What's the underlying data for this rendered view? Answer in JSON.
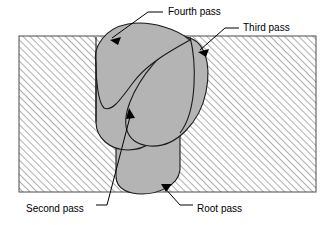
{
  "figure": {
    "colors": {
      "weld_fill": "#b4b4b4",
      "base_metal_fill": "#ffffff",
      "hatch_line": "#9a9a9a",
      "outline": "#1a1a1a",
      "background": "#ffffff",
      "text": "#000000"
    },
    "base_metal": {
      "name": "base-metal-plate",
      "hatch_angle_deg": 45,
      "hatch_spacing_px": 5,
      "bounds": {
        "x": 19,
        "y": 36,
        "width": 297,
        "height": 156
      }
    },
    "labels": [
      {
        "id": "fourth-pass",
        "text": "Fourth pass",
        "text_x": 168,
        "text_y": 12,
        "leader": "M 163 12 L 148 12 L 112 38",
        "arrow_tip_x": 110,
        "arrow_tip_y": 40,
        "arrow_angle_deg": 215
      },
      {
        "id": "third-pass",
        "text": "Third pass",
        "text_x": 243,
        "text_y": 28,
        "leader": "M 239 28 L 225 28 L 200 50",
        "arrow_tip_x": 198,
        "arrow_tip_y": 52,
        "arrow_angle_deg": 218
      },
      {
        "id": "second-pass",
        "text": "Second pass",
        "text_x": 26,
        "text_y": 209,
        "leader": "M 96 205 L 107 205 L 131 113",
        "arrow_tip_x": 129,
        "arrow_tip_y": 108,
        "arrow_angle_deg": 290
      },
      {
        "id": "root-pass",
        "text": "Root pass",
        "text_x": 197,
        "text_y": 209,
        "leader": "M 193 205 L 180 205 L 163 186",
        "arrow_tip_x": 161,
        "arrow_tip_y": 184,
        "arrow_angle_deg": 228
      }
    ],
    "weld_passes": [
      {
        "id": "root-pass-bead",
        "label": "Root pass",
        "order": 1,
        "path": "M 116 133 L 116 176 C 116 190 130 194 142 194 C 156 194 178 187 180 170 L 180 133 C 166 129 132 129 116 133 Z"
      },
      {
        "id": "second-pass-bead",
        "label": "Second pass",
        "order": 2,
        "path": "M 96 60 L 96 122 C 96 138 110 150 128 150 C 146 150 162 138 162 120 L 162 60 Z"
      },
      {
        "id": "third-pass-bead",
        "label": "Third pass",
        "order": 3,
        "path": "M 186 37 C 164 48 140 76 130 102 C 120 128 128 144 150 146 C 176 148 200 122 206 92 C 212 62 204 40 186 37 Z"
      },
      {
        "id": "fourth-pass-bead",
        "label": "Fourth pass",
        "order": 4,
        "path": "M 96 64 C 92 46 106 28 128 24 C 152 20 178 30 190 40 C 172 50 146 64 132 84 C 120 100 112 112 104 108 C 98 102 96 80 96 64 Z"
      }
    ],
    "groove_outline": {
      "name": "weld-groove-outline",
      "left_edge": "M 96 37 L 96 122",
      "right_edge": "M 190 37 C 196 60 198 110 180 133"
    }
  }
}
